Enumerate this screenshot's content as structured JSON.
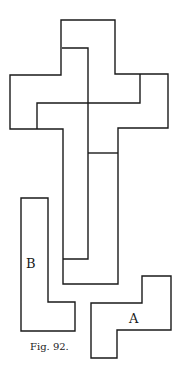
{
  "figure": {
    "caption": "Fig. 92.",
    "stroke_color": "#1a1a1a",
    "background_color": "#ffffff",
    "labels": {
      "piece_a": "A",
      "piece_b": "B"
    }
  }
}
